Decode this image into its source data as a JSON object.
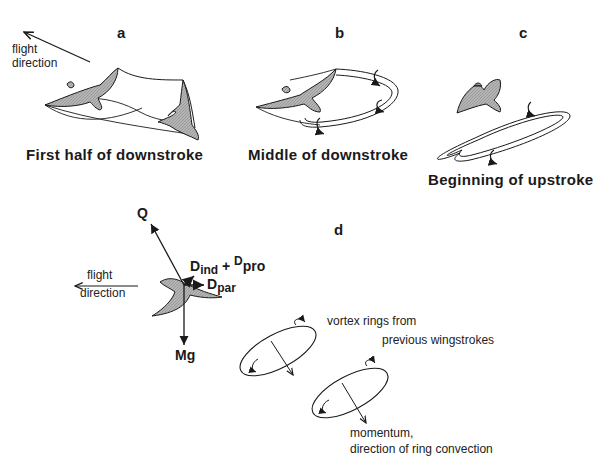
{
  "panels": {
    "a": {
      "letter": "a",
      "caption": "First half of downstroke",
      "flight_label_line1": "flight",
      "flight_label_line2": "direction"
    },
    "b": {
      "letter": "b",
      "caption": "Middle of downstroke"
    },
    "c": {
      "letter": "c",
      "caption": "Beginning of upstroke"
    },
    "d": {
      "letter": "d",
      "flight_label_line1": "flight",
      "flight_label_line2": "direction",
      "forces": {
        "lift": "Q",
        "weight": "Mg",
        "induced_drag_base": "D",
        "induced_drag_sub": "ind",
        "plus": "+",
        "profile_drag_base": "D",
        "profile_drag_sub": "pro",
        "parasite_drag_base": "D",
        "parasite_drag_sub": "par"
      },
      "vortex_note_line1": "vortex rings from",
      "vortex_note_line2": "previous wingstrokes",
      "momentum_note_line1": "momentum,",
      "momentum_note_line2": "direction of ring convection"
    }
  },
  "colors": {
    "ink": "#1a1a1a",
    "bird_fill": "#a8a8a8",
    "background": "#ffffff"
  }
}
